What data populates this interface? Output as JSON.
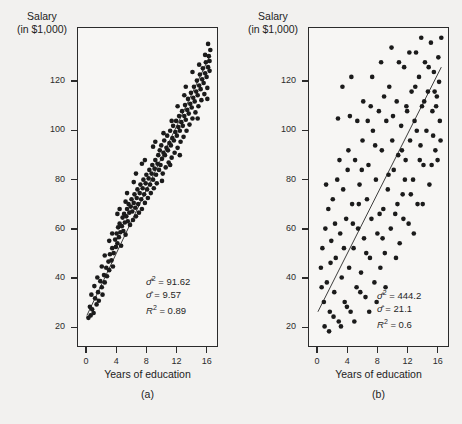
{
  "figure": {
    "yaxis_title_line1": "Salary",
    "yaxis_title_line2": "(in $1,000)",
    "xaxis_title": "Years of education"
  },
  "panels": [
    {
      "caption": "(a)",
      "stats": {
        "sigma_sq_label": "σ̂2 =",
        "sigma_sq_value": "91.62",
        "sigma_label": "σ̂ =",
        "sigma_value": "9.57",
        "r2_label": "R2 =",
        "r2_value": "0.89"
      }
    },
    {
      "caption": "(b)",
      "stats": {
        "sigma_sq_label": "σ̂2 =",
        "sigma_sq_value": "444.2",
        "sigma_label": "σ̂ =",
        "sigma_value": "21.1",
        "r2_label": "R2 =",
        "r2_value": "0.6"
      }
    }
  ],
  "chart_data": [
    {
      "type": "scatter",
      "title": "",
      "xlabel": "Years of education",
      "ylabel": "Salary (in $1,000)",
      "xlim": [
        -1.2,
        17.5
      ],
      "ylim": [
        12,
        142
      ],
      "xticks": [
        0,
        4,
        8,
        12,
        16
      ],
      "yticks": [
        20,
        40,
        60,
        80,
        100,
        120
      ],
      "grid": false,
      "legend": null,
      "annotations": [
        "σ̂² = 91.62",
        "σ̂ = 9.57",
        "R² = 0.89"
      ],
      "fit_line": {
        "type": "linear",
        "x": [
          0,
          16.6
        ],
        "y": [
          24.5,
          131.0
        ]
      },
      "stats": {
        "sigma_squared": 91.62,
        "sigma": 9.57,
        "r_squared": 0.89
      },
      "points": [
        [
          0.2,
          23.5
        ],
        [
          0.5,
          24.5
        ],
        [
          0.7,
          27.0
        ],
        [
          0.9,
          25.5
        ],
        [
          1.1,
          31.5
        ],
        [
          1.3,
          29.0
        ],
        [
          1.5,
          34.0
        ],
        [
          1.6,
          30.5
        ],
        [
          1.8,
          38.5
        ],
        [
          2.0,
          36.0
        ],
        [
          2.1,
          33.0
        ],
        [
          2.3,
          41.0
        ],
        [
          2.4,
          38.0
        ],
        [
          2.6,
          44.0
        ],
        [
          2.7,
          40.5
        ],
        [
          2.9,
          46.5
        ],
        [
          3.0,
          43.0
        ],
        [
          3.1,
          49.5
        ],
        [
          3.3,
          47.0
        ],
        [
          3.4,
          52.0
        ],
        [
          3.5,
          44.5
        ],
        [
          3.6,
          50.0
        ],
        [
          3.8,
          55.5
        ],
        [
          3.9,
          52.5
        ],
        [
          4.0,
          58.0
        ],
        [
          4.1,
          54.0
        ],
        [
          4.2,
          60.5
        ],
        [
          4.3,
          56.5
        ],
        [
          4.4,
          62.0
        ],
        [
          4.5,
          58.5
        ],
        [
          4.6,
          53.0
        ],
        [
          4.7,
          61.0
        ],
        [
          4.8,
          64.5
        ],
        [
          4.9,
          59.0
        ],
        [
          5.0,
          66.0
        ],
        [
          5.1,
          62.5
        ],
        [
          5.2,
          57.5
        ],
        [
          5.3,
          65.0
        ],
        [
          5.4,
          68.0
        ],
        [
          5.5,
          63.0
        ],
        [
          5.6,
          70.0
        ],
        [
          5.7,
          66.5
        ],
        [
          5.8,
          61.5
        ],
        [
          5.9,
          69.0
        ],
        [
          6.0,
          72.0
        ],
        [
          6.1,
          67.0
        ],
        [
          6.2,
          63.5
        ],
        [
          6.3,
          70.5
        ],
        [
          6.4,
          74.0
        ],
        [
          6.5,
          68.5
        ],
        [
          6.6,
          65.0
        ],
        [
          6.7,
          72.5
        ],
        [
          6.8,
          76.0
        ],
        [
          6.9,
          70.0
        ],
        [
          7.0,
          66.5
        ],
        [
          7.1,
          74.5
        ],
        [
          7.2,
          78.0
        ],
        [
          7.3,
          72.0
        ],
        [
          7.4,
          68.0
        ],
        [
          7.5,
          76.5
        ],
        [
          7.6,
          80.0
        ],
        [
          7.7,
          74.0
        ],
        [
          7.8,
          70.5
        ],
        [
          7.9,
          78.5
        ],
        [
          8.0,
          82.0
        ],
        [
          8.1,
          76.0
        ],
        [
          8.2,
          72.5
        ],
        [
          8.3,
          80.5
        ],
        [
          8.4,
          84.0
        ],
        [
          8.5,
          78.0
        ],
        [
          8.6,
          74.5
        ],
        [
          8.7,
          82.5
        ],
        [
          8.8,
          86.0
        ],
        [
          8.9,
          80.0
        ],
        [
          9.0,
          76.5
        ],
        [
          9.1,
          84.5
        ],
        [
          9.2,
          88.0
        ],
        [
          9.3,
          82.0
        ],
        [
          9.4,
          78.5
        ],
        [
          9.5,
          86.5
        ],
        [
          9.6,
          90.0
        ],
        [
          9.7,
          84.0
        ],
        [
          9.8,
          92.0
        ],
        [
          9.9,
          86.0
        ],
        [
          10.0,
          94.0
        ],
        [
          10.1,
          88.5
        ],
        [
          10.2,
          82.5
        ],
        [
          10.3,
          91.0
        ],
        [
          10.4,
          96.0
        ],
        [
          10.5,
          90.0
        ],
        [
          10.6,
          85.0
        ],
        [
          10.7,
          93.0
        ],
        [
          10.8,
          98.0
        ],
        [
          10.9,
          92.0
        ],
        [
          11.0,
          87.0
        ],
        [
          11.1,
          95.0
        ],
        [
          11.2,
          100.0
        ],
        [
          11.3,
          94.0
        ],
        [
          11.4,
          89.0
        ],
        [
          11.5,
          97.0
        ],
        [
          11.6,
          102.0
        ],
        [
          11.7,
          96.0
        ],
        [
          11.8,
          91.0
        ],
        [
          11.9,
          99.5
        ],
        [
          12.0,
          104.0
        ],
        [
          12.1,
          98.0
        ],
        [
          12.2,
          93.0
        ],
        [
          12.3,
          101.5
        ],
        [
          12.4,
          106.0
        ],
        [
          12.5,
          100.0
        ],
        [
          12.6,
          95.5
        ],
        [
          12.7,
          103.5
        ],
        [
          12.8,
          108.0
        ],
        [
          12.9,
          102.0
        ],
        [
          13.0,
          97.5
        ],
        [
          13.1,
          106.0
        ],
        [
          13.2,
          110.5
        ],
        [
          13.3,
          104.5
        ],
        [
          13.4,
          100.0
        ],
        [
          13.5,
          108.5
        ],
        [
          13.6,
          113.0
        ],
        [
          13.7,
          107.0
        ],
        [
          13.8,
          102.5
        ],
        [
          13.9,
          111.0
        ],
        [
          14.0,
          115.5
        ],
        [
          14.1,
          109.5
        ],
        [
          14.2,
          105.0
        ],
        [
          14.3,
          113.5
        ],
        [
          14.4,
          118.0
        ],
        [
          14.5,
          112.0
        ],
        [
          14.6,
          107.5
        ],
        [
          14.7,
          116.0
        ],
        [
          14.8,
          120.5
        ],
        [
          14.9,
          114.5
        ],
        [
          15.0,
          110.0
        ],
        [
          15.1,
          118.5
        ],
        [
          15.2,
          123.0
        ],
        [
          15.3,
          117.0
        ],
        [
          15.4,
          112.5
        ],
        [
          15.5,
          121.0
        ],
        [
          15.6,
          125.5
        ],
        [
          15.7,
          119.5
        ],
        [
          15.8,
          115.0
        ],
        [
          15.9,
          123.5
        ],
        [
          16.0,
          128.0
        ],
        [
          16.1,
          122.0
        ],
        [
          16.2,
          117.5
        ],
        [
          16.3,
          126.0
        ],
        [
          16.4,
          130.5
        ],
        [
          16.5,
          124.5
        ],
        [
          16.6,
          133.0
        ],
        [
          16.3,
          135.5
        ],
        [
          15.9,
          131.0
        ],
        [
          16.5,
          128.5
        ],
        [
          14.9,
          105.0
        ],
        [
          13.3,
          118.0
        ],
        [
          12.2,
          110.0
        ],
        [
          11.4,
          104.0
        ],
        [
          10.3,
          99.0
        ],
        [
          9.2,
          95.5
        ],
        [
          7.4,
          86.5
        ],
        [
          6.3,
          79.0
        ],
        [
          5.4,
          74.5
        ],
        [
          4.4,
          68.0
        ],
        [
          3.4,
          58.0
        ],
        [
          2.4,
          49.0
        ],
        [
          1.4,
          40.0
        ],
        [
          0.6,
          33.0
        ],
        [
          16.2,
          113.0
        ],
        [
          15.1,
          127.0
        ],
        [
          14.2,
          124.0
        ],
        [
          13.1,
          114.5
        ],
        [
          12.5,
          90.0
        ],
        [
          11.2,
          86.0
        ],
        [
          10.1,
          79.5
        ],
        [
          8.9,
          93.5
        ],
        [
          7.8,
          88.0
        ],
        [
          6.6,
          82.5
        ],
        [
          5.2,
          71.0
        ],
        [
          4.1,
          66.0
        ],
        [
          3.0,
          55.0
        ],
        [
          2.0,
          44.5
        ],
        [
          1.0,
          36.5
        ],
        [
          0.4,
          28.0
        ]
      ]
    },
    {
      "type": "scatter",
      "title": "",
      "xlabel": "Years of education",
      "ylabel": "Salary (in $1,000)",
      "xlim": [
        -1.2,
        17.5
      ],
      "ylim": [
        12,
        142
      ],
      "xticks": [
        0,
        4,
        8,
        12,
        16
      ],
      "yticks": [
        20,
        40,
        60,
        80,
        100,
        120
      ],
      "grid": false,
      "legend": null,
      "annotations": [
        "σ̂² = 444.2",
        "σ̂ = 21.1",
        "R² = 0.6"
      ],
      "fit_line": {
        "type": "linear",
        "x": [
          0,
          16.6
        ],
        "y": [
          26.0,
          126.0
        ]
      },
      "stats": {
        "sigma_squared": 444.2,
        "sigma": 21.1,
        "r_squared": 0.6
      },
      "points": [
        [
          0.4,
          44.0
        ],
        [
          0.6,
          52.0
        ],
        [
          0.8,
          30.0
        ],
        [
          1.0,
          60.0
        ],
        [
          1.2,
          38.0
        ],
        [
          1.4,
          68.0
        ],
        [
          1.6,
          26.0
        ],
        [
          1.8,
          55.0
        ],
        [
          2.0,
          72.0
        ],
        [
          2.2,
          34.0
        ],
        [
          2.4,
          48.0
        ],
        [
          2.6,
          80.0
        ],
        [
          2.8,
          22.0
        ],
        [
          3.0,
          58.0
        ],
        [
          3.2,
          40.0
        ],
        [
          3.4,
          76.0
        ],
        [
          3.6,
          30.0
        ],
        [
          3.8,
          64.0
        ],
        [
          4.0,
          84.0
        ],
        [
          4.2,
          44.0
        ],
        [
          4.4,
          26.0
        ],
        [
          4.6,
          70.0
        ],
        [
          4.8,
          52.0
        ],
        [
          5.0,
          88.0
        ],
        [
          5.2,
          36.0
        ],
        [
          5.4,
          60.0
        ],
        [
          5.6,
          78.0
        ],
        [
          5.8,
          42.0
        ],
        [
          6.0,
          96.0
        ],
        [
          6.2,
          56.0
        ],
        [
          6.4,
          32.0
        ],
        [
          6.6,
          72.0
        ],
        [
          6.8,
          86.0
        ],
        [
          7.0,
          48.0
        ],
        [
          7.2,
          64.0
        ],
        [
          7.4,
          100.0
        ],
        [
          7.6,
          38.0
        ],
        [
          7.8,
          80.0
        ],
        [
          8.0,
          58.0
        ],
        [
          8.2,
          108.0
        ],
        [
          8.4,
          44.0
        ],
        [
          8.6,
          92.0
        ],
        [
          8.8,
          68.0
        ],
        [
          9.0,
          50.0
        ],
        [
          9.2,
          104.0
        ],
        [
          9.4,
          76.0
        ],
        [
          9.6,
          118.0
        ],
        [
          9.8,
          60.0
        ],
        [
          10.0,
          96.0
        ],
        [
          10.2,
          84.0
        ],
        [
          10.4,
          66.0
        ],
        [
          10.6,
          112.0
        ],
        [
          10.8,
          90.0
        ],
        [
          11.0,
          54.0
        ],
        [
          11.2,
          102.0
        ],
        [
          11.4,
          74.0
        ],
        [
          11.6,
          126.0
        ],
        [
          11.8,
          88.0
        ],
        [
          12.0,
          108.0
        ],
        [
          12.2,
          62.0
        ],
        [
          12.4,
          96.0
        ],
        [
          12.6,
          116.0
        ],
        [
          12.8,
          80.0
        ],
        [
          13.0,
          104.0
        ],
        [
          13.2,
          132.0
        ],
        [
          13.4,
          70.0
        ],
        [
          13.6,
          122.0
        ],
        [
          13.8,
          94.0
        ],
        [
          14.0,
          110.0
        ],
        [
          14.2,
          86.0
        ],
        [
          14.4,
          128.0
        ],
        [
          14.6,
          100.0
        ],
        [
          14.8,
          116.0
        ],
        [
          15.0,
          78.0
        ],
        [
          15.2,
          136.0
        ],
        [
          15.4,
          108.0
        ],
        [
          15.6,
          124.0
        ],
        [
          15.8,
          92.0
        ],
        [
          16.0,
          114.0
        ],
        [
          16.2,
          130.0
        ],
        [
          16.4,
          104.0
        ],
        [
          16.6,
          138.0
        ],
        [
          16.3,
          120.0
        ],
        [
          15.9,
          110.0
        ],
        [
          15.5,
          98.0
        ],
        [
          14.9,
          126.0
        ],
        [
          14.3,
          112.0
        ],
        [
          13.7,
          88.0
        ],
        [
          13.1,
          118.0
        ],
        [
          12.5,
          74.0
        ],
        [
          11.9,
          110.0
        ],
        [
          11.3,
          92.0
        ],
        [
          10.7,
          70.0
        ],
        [
          10.1,
          106.0
        ],
        [
          9.5,
          82.0
        ],
        [
          8.9,
          114.0
        ],
        [
          8.3,
          66.0
        ],
        [
          7.7,
          94.0
        ],
        [
          7.1,
          110.0
        ],
        [
          6.5,
          50.0
        ],
        [
          5.9,
          84.0
        ],
        [
          5.3,
          104.0
        ],
        [
          4.7,
          62.0
        ],
        [
          4.1,
          92.0
        ],
        [
          3.5,
          52.0
        ],
        [
          2.9,
          88.0
        ],
        [
          2.3,
          62.0
        ],
        [
          1.7,
          46.0
        ],
        [
          1.1,
          78.0
        ],
        [
          0.5,
          36.0
        ],
        [
          0.9,
          20.0
        ],
        [
          1.5,
          18.0
        ],
        [
          2.1,
          24.0
        ],
        [
          3.1,
          20.0
        ],
        [
          3.9,
          28.0
        ],
        [
          4.9,
          22.0
        ],
        [
          5.7,
          34.0
        ],
        [
          6.9,
          26.0
        ],
        [
          7.9,
          30.0
        ],
        [
          9.1,
          36.0
        ],
        [
          2.7,
          105.0
        ],
        [
          3.3,
          118.0
        ],
        [
          4.5,
          122.0
        ],
        [
          5.5,
          70.0
        ],
        [
          6.1,
          112.0
        ],
        [
          7.3,
          122.0
        ],
        [
          8.5,
          128.0
        ],
        [
          9.9,
          134.0
        ],
        [
          11.5,
          64.0
        ],
        [
          12.9,
          58.0
        ],
        [
          14.1,
          70.0
        ],
        [
          15.3,
          86.0
        ],
        [
          16.5,
          96.0
        ],
        [
          13.9,
          138.0
        ],
        [
          12.3,
          132.0
        ],
        [
          10.9,
          128.0
        ],
        [
          4.3,
          106.0
        ],
        [
          6.7,
          104.0
        ],
        [
          8.7,
          56.0
        ],
        [
          10.5,
          48.0
        ],
        [
          11.7,
          80.0
        ],
        [
          13.3,
          100.0
        ],
        [
          15.7,
          116.0
        ],
        [
          16.1,
          88.0
        ]
      ]
    }
  ]
}
